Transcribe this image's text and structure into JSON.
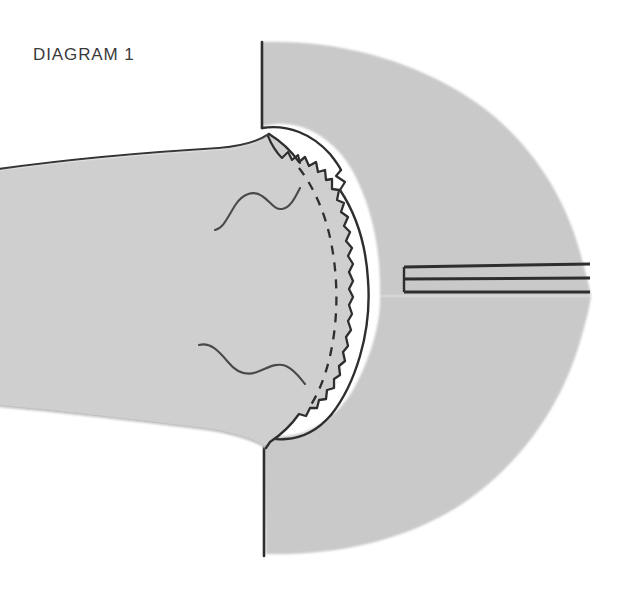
{
  "figure": {
    "caption": "DIAGRAM 1",
    "caption_position": {
      "x": 33,
      "y": 60
    },
    "background_color": "#ffffff",
    "canvas": {
      "width": 635,
      "height": 596
    }
  },
  "palette": {
    "tissue_fill": "#c9c9c9",
    "tissue_fill_light": "#cfcfcf",
    "outline": "#2e2e2e",
    "outline_soft": "#444444",
    "gap_fill": "#ffffff",
    "dashed_line": "#2e2e2e",
    "band_fill": "#bdbdbd",
    "caption_color": "#3a3a3a"
  },
  "regions": [
    {
      "name": "right-mass-upper",
      "label": "upper right tissue mass",
      "fill": "#c9c9c9",
      "outlined": false,
      "description": "large rounded mass occupying upper right, soft unoutlined outer margin"
    },
    {
      "name": "right-mass-lower",
      "label": "lower right tissue mass",
      "fill": "#c9c9c9",
      "outlined": false,
      "description": "large rounded mass occupying lower right, soft unoutlined outer margin"
    },
    {
      "name": "left-structure",
      "label": "left wedge structure",
      "fill": "#cfcfcf",
      "outlined": true,
      "description": "tapering band entering from left edge, outlined top and bottom"
    },
    {
      "name": "central-dome",
      "label": "central domed body",
      "fill": "#cfcfcf",
      "outlined": true,
      "description": "dome with serrated right margin, surrounded by white gap"
    }
  ],
  "annotations": [
    {
      "name": "dashed-contour",
      "label": "dashed internal contour",
      "style": "dashed"
    },
    {
      "name": "squiggle-upper",
      "label": "upper wavy internal marking",
      "style": "solid"
    },
    {
      "name": "squiggle-lower",
      "label": "lower wavy internal marking",
      "style": "solid"
    },
    {
      "name": "horizontal-band",
      "label": "horizontal banded structure",
      "style": "solid",
      "line_count": 3
    }
  ]
}
